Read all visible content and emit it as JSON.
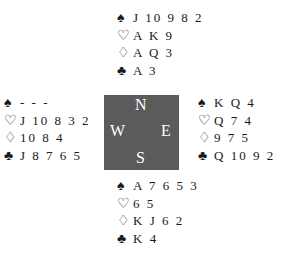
{
  "deal": {
    "north": {
      "spades": "J10982",
      "hearts": "AK9",
      "diamonds": "AQ3",
      "clubs": "A3"
    },
    "west": {
      "spades": "---",
      "hearts": "J10832",
      "diamonds": "1084",
      "clubs": "J8765"
    },
    "east": {
      "spades": "KQ4",
      "hearts": "Q74",
      "diamonds": "975",
      "clubs": "Q1092"
    },
    "south": {
      "spades": "A7653",
      "hearts": "65",
      "diamonds": "KJ62",
      "clubs": "K4"
    }
  },
  "display": {
    "north": {
      "spades": "J 10 9 8 2",
      "hearts": "A K 9",
      "diamonds": "A Q 3",
      "clubs": "A 3"
    },
    "west": {
      "spades": "- - -",
      "hearts": "J 10 8 3 2",
      "diamonds": "10 8 4",
      "clubs": "J 8 7 6 5"
    },
    "east": {
      "spades": "K Q 4",
      "hearts": "Q 7 4",
      "diamonds": "9 7 5",
      "clubs": "Q 10 9 2"
    },
    "south": {
      "spades": "A 7 6 5 3",
      "hearts": "6 5",
      "diamonds": "K J 6 2",
      "clubs": "K 4"
    }
  },
  "suits": {
    "spades": "♠",
    "hearts": "♡",
    "diamonds": "♢",
    "clubs": "♣"
  },
  "compass": {
    "n": "N",
    "s": "S",
    "w": "W",
    "e": "E",
    "color": "#5b5b5b"
  }
}
